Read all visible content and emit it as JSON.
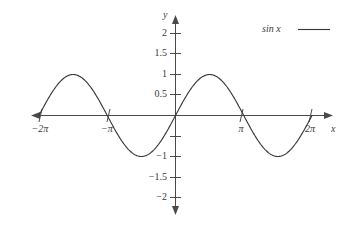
{
  "chart_data": {
    "type": "line",
    "title": "",
    "xlabel": "x",
    "ylabel": "y",
    "xlim": [
      -7.3304,
      7.3304
    ],
    "ylim": [
      -2.25,
      2.25
    ],
    "grid": false,
    "legend_position": "top-right",
    "series": [
      {
        "name": "sin x",
        "expression": "sin(x)",
        "color": "#3a3a3a",
        "amplitude": 1,
        "period": 6.28319,
        "x": [
          -6.28319,
          -5.49779,
          -4.71239,
          -3.92699,
          -3.14159,
          -2.35619,
          -1.5708,
          -0.7854,
          0,
          0.7854,
          1.5708,
          2.35619,
          3.14159,
          3.92699,
          4.71239,
          5.49779,
          6.28319
        ],
        "y": [
          0,
          0.7071,
          1,
          0.7071,
          0,
          -0.7071,
          -1,
          -0.7071,
          0,
          0.7071,
          1,
          0.7071,
          0,
          -0.7071,
          -1,
          -0.7071,
          0
        ]
      }
    ],
    "y_ticks": [
      {
        "value": 2,
        "label": "2"
      },
      {
        "value": 1.5,
        "label": "1.5"
      },
      {
        "value": 1,
        "label": "1"
      },
      {
        "value": 0.5,
        "label": "0.5"
      },
      {
        "value": -1,
        "label": "−1"
      },
      {
        "value": -1.5,
        "label": "−1.5"
      },
      {
        "value": -2,
        "label": "−2"
      }
    ],
    "x_ticks": [
      {
        "value": -6.28319,
        "label": "−2π"
      },
      {
        "value": -3.14159,
        "label": "−π"
      },
      {
        "value": 3.14159,
        "label": "π"
      },
      {
        "value": 6.28319,
        "label": "2π"
      }
    ]
  },
  "axes": {
    "x_axis_label": "x",
    "y_axis_label": "y"
  },
  "legend": {
    "entries": [
      {
        "label": "sin x",
        "color": "#3a3a3a"
      }
    ]
  },
  "colors": {
    "curve": "#3a3a3a",
    "axis": "#4a4a4a",
    "text": "#3a3a3a",
    "background": "#ffffff"
  }
}
